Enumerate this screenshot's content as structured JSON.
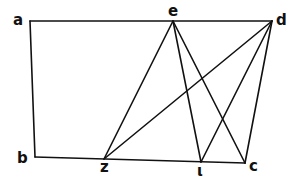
{
  "diagram": {
    "points": [
      {
        "id": "a",
        "label": "a",
        "x": 30,
        "y": 21,
        "lx": 13,
        "ly": 25
      },
      {
        "id": "e",
        "label": "e",
        "x": 173,
        "y": 21,
        "lx": 168,
        "ly": 16
      },
      {
        "id": "d",
        "label": "d",
        "x": 272,
        "y": 21,
        "lx": 276,
        "ly": 25
      },
      {
        "id": "b",
        "label": "b",
        "x": 35,
        "y": 157,
        "lx": 17,
        "ly": 163
      },
      {
        "id": "z",
        "label": "z",
        "x": 104,
        "y": 159,
        "lx": 100,
        "ly": 172
      },
      {
        "id": "i",
        "label": "ι",
        "x": 201,
        "y": 162,
        "lx": 197,
        "ly": 176
      },
      {
        "id": "c",
        "label": "c",
        "x": 245,
        "y": 163,
        "lx": 249,
        "ly": 171
      }
    ],
    "lines": [
      [
        "a",
        "d"
      ],
      [
        "a",
        "b"
      ],
      [
        "b",
        "c"
      ],
      [
        "d",
        "c"
      ],
      [
        "e",
        "z"
      ],
      [
        "e",
        "i"
      ],
      [
        "e",
        "c"
      ],
      [
        "d",
        "z"
      ],
      [
        "d",
        "i"
      ]
    ],
    "color": "#111111"
  }
}
